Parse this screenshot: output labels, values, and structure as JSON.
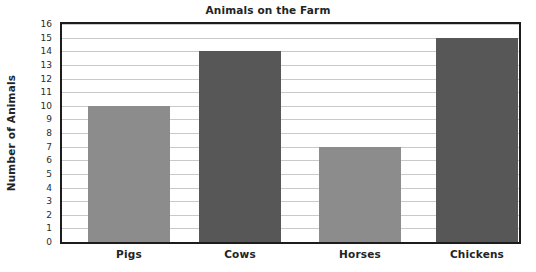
{
  "chart_data": {
    "type": "bar",
    "title": "Animals on the Farm",
    "xlabel": "",
    "ylabel": "Number of Animals",
    "categories": [
      "Pigs",
      "Cows",
      "Horses",
      "Chickens"
    ],
    "values": [
      10,
      14,
      7,
      15
    ],
    "series": [
      {
        "name": "Number of Animals",
        "values": [
          10,
          14,
          7,
          15
        ]
      }
    ],
    "bar_colors": [
      "#8c8c8c",
      "#575757",
      "#8c8c8c",
      "#575757"
    ],
    "ylim": [
      0,
      16
    ],
    "ytick_step": 1,
    "ytick_labels": [
      "16",
      "15",
      "14",
      "13",
      "12",
      "11",
      "10",
      "9",
      "8",
      "7",
      "6",
      "5",
      "4",
      "3",
      "2",
      "1",
      "0"
    ],
    "grid": true,
    "grid_color": "#c9c9c9",
    "legend": false,
    "legend_position": "none",
    "axis_color": "#1c1c1c",
    "text_color": "#242424",
    "background": "#ffffff"
  }
}
